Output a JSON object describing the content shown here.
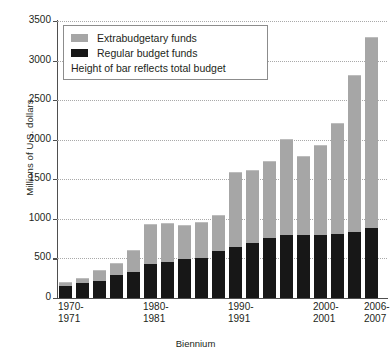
{
  "chart_data": {
    "type": "bar",
    "title": "",
    "subtitle": "",
    "xlabel": "Biennium",
    "ylabel": "Millions of U.S. dollars",
    "ylim": [
      0,
      3500
    ],
    "ytick_values": [
      0,
      500,
      1000,
      1500,
      2000,
      2500,
      3000,
      3500
    ],
    "ytick_labels": [
      "0",
      "500",
      "1000",
      "1500",
      "2000",
      "2500",
      "3000",
      "3500"
    ],
    "grid": true,
    "grid_style": "dotted-horizontal",
    "stacked": true,
    "legend_position": "top-left-inside",
    "legend_entries": [
      "Extrabudgetary funds",
      "Regular budget funds"
    ],
    "annotations": [
      "Height of bar reflects total budget"
    ],
    "categories": [
      "1970-1971",
      "1972-1973",
      "1974-1975",
      "1976-1977",
      "1978-1979",
      "1980-1981",
      "1982-1983",
      "1984-1985",
      "1986-1987",
      "1988-1989",
      "1990-1991",
      "1992-1993",
      "1994-1995",
      "1996-1997",
      "1998-1999",
      "2000-2001",
      "2002-2003",
      "2004-2005",
      "2006-2007"
    ],
    "xtick_labels": [
      {
        "index": 0,
        "line1": "1970-",
        "line2": "1971"
      },
      {
        "index": 5,
        "line1": "1980-",
        "line2": "1981"
      },
      {
        "index": 10,
        "line1": "1990-",
        "line2": "1991"
      },
      {
        "index": 15,
        "line1": "2000-",
        "line2": "2001"
      },
      {
        "index": 18,
        "line1": "2006-",
        "line2": "2007"
      }
    ],
    "series": [
      {
        "name": "Regular budget funds",
        "color": "#171717",
        "values": [
          150,
          185,
          215,
          290,
          330,
          430,
          450,
          490,
          500,
          590,
          640,
          700,
          760,
          790,
          800,
          800,
          810,
          840,
          880
        ]
      },
      {
        "name": "Extrabudgetary funds",
        "color": "#a6a6a6",
        "values": [
          35,
          55,
          125,
          145,
          270,
          490,
          490,
          420,
          450,
          450,
          940,
          900,
          960,
          1210,
          980,
          1120,
          1390,
          1960,
          2400
        ]
      }
    ],
    "totals": [
      185,
      240,
      340,
      435,
      600,
      920,
      940,
      910,
      950,
      1040,
      1580,
      1600,
      1720,
      2000,
      1780,
      1920,
      2200,
      2800,
      3280
    ]
  },
  "legend": {
    "extra_label": "Extrabudgetary funds",
    "regular_label": "Regular budget funds",
    "note": "Height of bar reflects total budget"
  },
  "axes": {
    "y_title": "Millions of U.S. dollars",
    "x_title": "Biennium"
  },
  "colors": {
    "extrabudgetary": "#a6a6a6",
    "regular": "#171717",
    "axis": "#4f4f4f",
    "grid": "#a9a9a9",
    "text": "#231f20",
    "background": "#ffffff"
  }
}
